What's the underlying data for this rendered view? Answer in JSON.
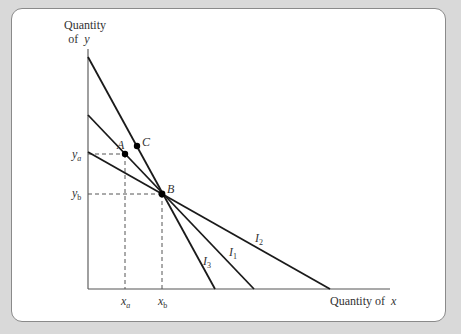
{
  "diagram": {
    "y_axis_label_line1": "Quantity",
    "y_axis_label_line2": "of",
    "y_axis_var": "y",
    "x_axis_label": "Quantity of",
    "x_axis_var": "x",
    "points": {
      "A": {
        "label": "A"
      },
      "B": {
        "label": "B"
      },
      "C": {
        "label": "C"
      }
    },
    "ticks": {
      "ya": {
        "base": "y",
        "sub": "a"
      },
      "yb": {
        "base": "y",
        "sub": "b"
      },
      "xa": {
        "base": "x",
        "sub": "a"
      },
      "xb": {
        "base": "x",
        "sub": "b"
      }
    },
    "curves": {
      "I1": {
        "base": "I",
        "sub": "1"
      },
      "I2": {
        "base": "I",
        "sub": "2"
      },
      "I3": {
        "base": "I",
        "sub": "3"
      }
    },
    "colors": {
      "line": "#1a1a1a",
      "axis": "#555555",
      "dashed": "#555555",
      "background": "#d9d9d9",
      "card": "#ffffff"
    }
  }
}
